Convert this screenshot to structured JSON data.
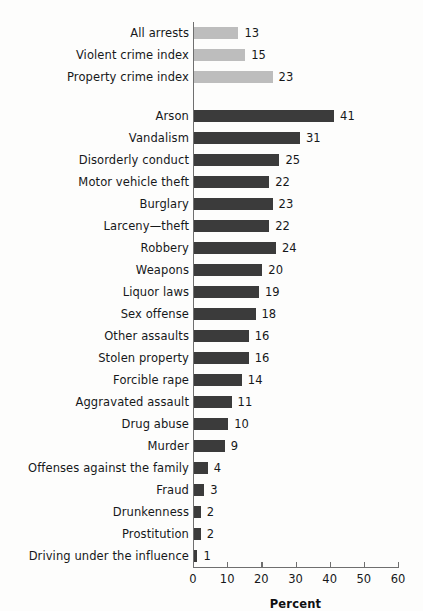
{
  "chart_data": {
    "type": "bar",
    "orientation": "horizontal",
    "title": "",
    "subtitle": "",
    "xlabel": "Percent",
    "ylabel": "",
    "xlim": [
      0,
      60
    ],
    "xticks": [
      0,
      10,
      20,
      30,
      40,
      50,
      60
    ],
    "xtick_labels": [
      "0",
      "10",
      "20",
      "30",
      "40",
      "50",
      "60"
    ],
    "grid": false,
    "legend": null,
    "categories": [
      "All arrests",
      "Violent crime index",
      "Property crime index",
      "Arson",
      "Vandalism",
      "Disorderly conduct",
      "Motor vehicle theft",
      "Burglary",
      "Larceny—theft",
      "Robbery",
      "Weapons",
      "Liquor laws",
      "Sex offense",
      "Other assaults",
      "Stolen property",
      "Forcible rape",
      "Aggravated assault",
      "Drug abuse",
      "Murder",
      "Offenses against the family",
      "Fraud",
      "Drunkenness",
      "Prostitution",
      "Driving under the influence"
    ],
    "values": [
      13,
      15,
      23,
      41,
      31,
      25,
      22,
      23,
      22,
      24,
      20,
      19,
      18,
      16,
      16,
      14,
      11,
      10,
      9,
      4,
      3,
      2,
      2,
      1
    ],
    "value_labels": [
      "13",
      "15",
      "23",
      "41",
      "31",
      "25",
      "22",
      "23",
      "22",
      "24",
      "20",
      "19",
      "18",
      "16",
      "16",
      "14",
      "11",
      "10",
      "9",
      "4",
      "3",
      "2",
      "2",
      "1"
    ],
    "colors": {
      "summary_bar": "#bdbdbd",
      "category_bar": "#3b3b3b",
      "axis": "#6f6f6f",
      "text": "#16181a",
      "background": "#fdfdfc"
    },
    "groups": [
      {
        "name": "summary",
        "style": "light",
        "count": 3
      },
      {
        "name": "offense-categories",
        "style": "dark",
        "count": 21
      }
    ]
  }
}
